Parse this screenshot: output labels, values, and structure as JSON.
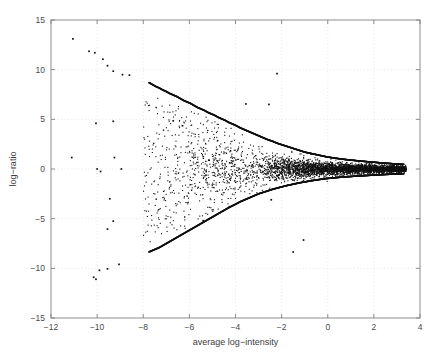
{
  "figure": {
    "background_color": "#ffffff",
    "axes_color": "#808080",
    "grid_color": "#dcdcdc",
    "marker_color": "#101010",
    "text_color": "#4a4a4a"
  },
  "chart_data": {
    "type": "scatter",
    "title": "",
    "xlabel": "average log−intensity",
    "ylabel": "log−ratio",
    "xlim": [
      -12,
      4
    ],
    "ylim": [
      -15,
      15
    ],
    "xticks": [
      -12,
      -10,
      -8,
      -6,
      -4,
      -2,
      0,
      2,
      4
    ],
    "xtick_labels": [
      "−12",
      "−10",
      "−8",
      "−6",
      "−4",
      "−2",
      "0",
      "2",
      "4"
    ],
    "yticks": [
      -15,
      -10,
      -5,
      0,
      5,
      10,
      15
    ],
    "ytick_labels": [
      "−15",
      "−10",
      "−5",
      "0",
      "5",
      "10",
      "15"
    ],
    "grid": true,
    "grid_style": "dotted",
    "legend": null,
    "marker": "dot",
    "marker_size": 1.1,
    "series": [
      {
        "name": "upper-boundary-curve",
        "role": "boundary",
        "x": [
          -7.75,
          -7.6,
          -7.45,
          -7.3,
          -7.15,
          -7.0,
          -6.85,
          -6.7,
          -6.55,
          -6.4,
          -6.25,
          -6.1,
          -5.95,
          -5.8,
          -5.65,
          -5.5,
          -5.35,
          -5.2,
          -5.05,
          -4.9,
          -4.75,
          -4.6,
          -4.45,
          -4.3,
          -4.15,
          -4.0,
          -3.8,
          -3.6,
          -3.4,
          -3.2,
          -3.0,
          -2.8,
          -2.6,
          -2.4,
          -2.2,
          -2.0,
          -1.8,
          -1.6,
          -1.4,
          -1.2,
          -1.0,
          -0.8,
          -0.6,
          -0.4,
          -0.2,
          0.0,
          0.3,
          0.6,
          0.9,
          1.2,
          1.5,
          1.8,
          2.1,
          2.4,
          2.7,
          3.0,
          3.3
        ],
        "y": [
          8.7,
          8.5,
          8.3,
          8.15,
          7.95,
          7.8,
          7.6,
          7.45,
          7.3,
          7.1,
          6.9,
          6.75,
          6.6,
          6.4,
          6.2,
          6.05,
          5.9,
          5.7,
          5.55,
          5.4,
          5.2,
          5.05,
          4.9,
          4.7,
          4.55,
          4.4,
          4.15,
          3.95,
          3.75,
          3.55,
          3.35,
          3.15,
          2.95,
          2.8,
          2.6,
          2.45,
          2.3,
          2.15,
          2.0,
          1.85,
          1.7,
          1.6,
          1.5,
          1.4,
          1.3,
          1.2,
          1.1,
          1.0,
          0.92,
          0.85,
          0.78,
          0.72,
          0.66,
          0.6,
          0.55,
          0.5,
          0.46
        ]
      },
      {
        "name": "lower-boundary-curve",
        "role": "boundary",
        "x": [
          -7.75,
          -7.6,
          -7.45,
          -7.3,
          -7.15,
          -7.0,
          -6.85,
          -6.7,
          -6.55,
          -6.4,
          -6.25,
          -6.1,
          -5.95,
          -5.8,
          -5.65,
          -5.5,
          -5.35,
          -5.2,
          -5.05,
          -4.9,
          -4.75,
          -4.6,
          -4.45,
          -4.3,
          -4.15,
          -4.0,
          -3.8,
          -3.6,
          -3.4,
          -3.2,
          -3.0,
          -2.8,
          -2.6,
          -2.4,
          -2.2,
          -2.0,
          -1.8,
          -1.6,
          -1.4,
          -1.2,
          -1.0,
          -0.8,
          -0.6,
          -0.4,
          -0.2,
          0.0,
          0.3,
          0.6,
          0.9,
          1.2,
          1.5,
          1.8,
          2.1,
          2.4,
          2.7,
          3.0,
          3.3
        ],
        "y": [
          -8.35,
          -8.2,
          -8.05,
          -7.9,
          -7.7,
          -7.5,
          -7.3,
          -7.1,
          -6.9,
          -6.7,
          -6.5,
          -6.3,
          -6.1,
          -5.9,
          -5.7,
          -5.5,
          -5.3,
          -5.1,
          -4.9,
          -4.7,
          -4.5,
          -4.3,
          -4.1,
          -3.9,
          -3.72,
          -3.55,
          -3.3,
          -3.1,
          -2.9,
          -2.7,
          -2.5,
          -2.35,
          -2.2,
          -2.05,
          -1.92,
          -1.8,
          -1.68,
          -1.58,
          -1.48,
          -1.38,
          -1.3,
          -1.22,
          -1.14,
          -1.07,
          -1.0,
          -0.95,
          -0.88,
          -0.82,
          -0.77,
          -0.72,
          -0.68,
          -0.64,
          -0.6,
          -0.56,
          -0.53,
          -0.5,
          -0.47
        ]
      },
      {
        "name": "far-left-outliers",
        "role": "outliers",
        "x": [
          -11.05,
          -10.35,
          -10.1,
          -9.75,
          -9.55,
          -9.3,
          -8.9,
          -8.6,
          -11.1,
          -10.05,
          -10.0,
          -9.85,
          -9.3,
          -9.25,
          -8.95,
          -9.45,
          -9.3,
          -9.55,
          -9.05,
          -10.15,
          -10.05,
          -9.9,
          -9.55,
          -2.45,
          -1.5,
          -1.05,
          -5.4,
          -3.55,
          -2.55,
          -2.2,
          -6.7,
          -6.3
        ],
        "y": [
          13.1,
          11.85,
          11.7,
          11.05,
          10.4,
          9.85,
          9.5,
          9.45,
          1.15,
          4.6,
          0.0,
          -0.25,
          4.8,
          1.15,
          0.0,
          -3.0,
          -5.25,
          -6.05,
          -9.6,
          -10.9,
          -11.1,
          -10.2,
          -10.05,
          -3.1,
          -8.35,
          -7.15,
          -5.2,
          6.55,
          6.5,
          9.6,
          4.85,
          4.35
        ]
      },
      {
        "name": "main-cloud",
        "role": "data",
        "n_points": 2400,
        "x_range": [
          -8.0,
          3.4
        ],
        "y_center": 0.0,
        "note": "Dense funnel-shaped point cloud, spread decreasing with increasing intensity"
      }
    ]
  }
}
